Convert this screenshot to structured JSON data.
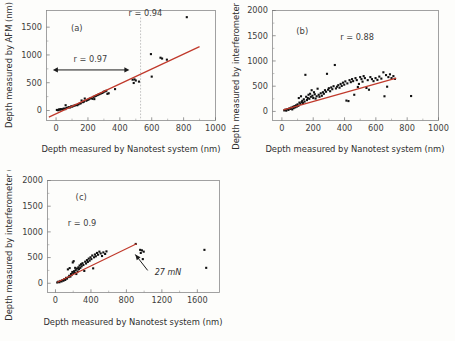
{
  "figure": {
    "background_color": "#fdfdfb",
    "point_color": "#111111",
    "fit_line_color": "#c0392b",
    "axis_color": "#8a8a8a"
  },
  "panels": [
    {
      "id": "a",
      "label": "(a)",
      "xlabel": "Depth measured by Nanotest system (nm)",
      "ylabel": "Depth measured by AFM (nm)",
      "xlim": [
        -60,
        1000
      ],
      "ylim": [
        -180,
        1800
      ],
      "xticks": [
        0,
        200,
        400,
        600,
        800,
        1000
      ],
      "yticks": [
        0,
        500,
        1000,
        1500
      ],
      "xticklabels": [
        "0",
        "200",
        "400",
        "600",
        "800",
        "1000"
      ],
      "yticklabels": [
        "0",
        "500",
        "1000",
        "1500"
      ],
      "annotations": [
        {
          "name": "r-overall",
          "text": "r = 0.94",
          "x": 560,
          "y": 1700
        },
        {
          "name": "r-restricted",
          "text": "r = 0.97",
          "x": 215,
          "y": 880
        }
      ],
      "vertical_divider_x": 530,
      "range_arrow": {
        "x_start": -20,
        "x_end": 460,
        "y": 730
      },
      "fit_line": {
        "x1": -45,
        "y1": -120,
        "x2": 900,
        "y2": 1150
      }
    },
    {
      "id": "b",
      "label": "(b)",
      "xlabel": "Depth measured by Nanotest system (nm)",
      "ylabel": "Depth measured by interferometer (nm)",
      "xlim": [
        -60,
        1000
      ],
      "ylim": [
        -180,
        2000
      ],
      "xticks": [
        0,
        200,
        400,
        600,
        800,
        1000
      ],
      "yticks": [
        0,
        500,
        1000,
        1500,
        2000
      ],
      "xticklabels": [
        "0",
        "200",
        "400",
        "600",
        "800",
        "1000"
      ],
      "yticklabels": [
        "0",
        "500",
        "1000",
        "1500",
        "2000"
      ],
      "annotations": [
        {
          "name": "r-overall",
          "text": "r = 0.88",
          "x": 480,
          "y": 1420
        }
      ],
      "fit_line": {
        "x1": 10,
        "y1": 30,
        "x2": 730,
        "y2": 660
      }
    },
    {
      "id": "c",
      "label": "(c)",
      "xlabel": "Depth measured by Nanotest system (nm)",
      "ylabel": "Depth measured by interferometer (nm)",
      "xlim": [
        -90,
        1850
      ],
      "ylim": [
        -180,
        2000
      ],
      "xticks": [
        0,
        400,
        800,
        1200,
        1600
      ],
      "yticks": [
        0,
        500,
        1000,
        1500,
        2000
      ],
      "xticklabels": [
        "0",
        "400",
        "800",
        "1200",
        "1600"
      ],
      "yticklabels": [
        "0",
        "500",
        "1000",
        "1500",
        "2000"
      ],
      "annotations": [
        {
          "name": "r-overall",
          "text": "r = 0.9",
          "x": 300,
          "y": 1120
        },
        {
          "name": "load-annotation",
          "text": "27 mN",
          "x": 1060,
          "y": 190
        }
      ],
      "load_arrow": {
        "x_start": 1040,
        "y_start": 250,
        "x_end": 900,
        "y_end": 560
      },
      "fit_line": {
        "x1": 20,
        "y1": 20,
        "x2": 915,
        "y2": 770
      }
    }
  ],
  "chart_data": [
    {
      "type": "scatter",
      "panel": "a",
      "title": "(a)",
      "xlabel": "Depth measured by Nanotest system (nm)",
      "ylabel": "Depth measured by AFM (nm)",
      "xlim": [
        -60,
        1000
      ],
      "ylim": [
        -180,
        1800
      ],
      "grid": false,
      "legend": "none",
      "correlation_overall": 0.94,
      "correlation_restricted": 0.97,
      "points": [
        [
          5,
          10
        ],
        [
          12,
          5
        ],
        [
          18,
          20
        ],
        [
          25,
          15
        ],
        [
          30,
          25
        ],
        [
          38,
          20
        ],
        [
          45,
          30
        ],
        [
          52,
          35
        ],
        [
          58,
          25
        ],
        [
          65,
          45
        ],
        [
          60,
          95
        ],
        [
          72,
          50
        ],
        [
          80,
          60
        ],
        [
          88,
          55
        ],
        [
          95,
          75
        ],
        [
          102,
          70
        ],
        [
          110,
          85
        ],
        [
          118,
          90
        ],
        [
          125,
          100
        ],
        [
          133,
          95
        ],
        [
          140,
          110
        ],
        [
          148,
          125
        ],
        [
          155,
          130
        ],
        [
          160,
          180
        ],
        [
          168,
          150
        ],
        [
          175,
          160
        ],
        [
          180,
          215
        ],
        [
          190,
          175
        ],
        [
          198,
          190
        ],
        [
          205,
          200
        ],
        [
          212,
          215
        ],
        [
          220,
          225
        ],
        [
          228,
          210
        ],
        [
          235,
          245
        ],
        [
          243,
          255
        ],
        [
          240,
          205
        ],
        [
          250,
          265
        ],
        [
          258,
          275
        ],
        [
          265,
          285
        ],
        [
          272,
          295
        ],
        [
          280,
          305
        ],
        [
          288,
          315
        ],
        [
          295,
          325
        ],
        [
          300,
          340
        ],
        [
          308,
          345
        ],
        [
          315,
          355
        ],
        [
          322,
          300
        ],
        [
          330,
          310
        ],
        [
          370,
          385
        ],
        [
          480,
          555
        ],
        [
          487,
          495
        ],
        [
          492,
          560
        ],
        [
          500,
          540
        ],
        [
          520,
          520
        ],
        [
          595,
          1015
        ],
        [
          600,
          610
        ],
        [
          655,
          950
        ],
        [
          665,
          935
        ],
        [
          695,
          915
        ],
        [
          820,
          1680
        ]
      ]
    },
    {
      "type": "scatter",
      "panel": "b",
      "title": "(b)",
      "xlabel": "Depth measured by Nanotest system (nm)",
      "ylabel": "Depth measured by interferometer (nm)",
      "xlim": [
        -60,
        1000
      ],
      "ylim": [
        -180,
        2000
      ],
      "grid": false,
      "legend": "none",
      "correlation_overall": 0.88,
      "points": [
        [
          15,
          20
        ],
        [
          22,
          35
        ],
        [
          28,
          15
        ],
        [
          35,
          45
        ],
        [
          42,
          30
        ],
        [
          48,
          60
        ],
        [
          55,
          50
        ],
        [
          60,
          75
        ],
        [
          66,
          40
        ],
        [
          70,
          90
        ],
        [
          75,
          65
        ],
        [
          80,
          105
        ],
        [
          85,
          80
        ],
        [
          90,
          120
        ],
        [
          95,
          95
        ],
        [
          100,
          140
        ],
        [
          105,
          110
        ],
        [
          108,
          265
        ],
        [
          112,
          175
        ],
        [
          118,
          150
        ],
        [
          122,
          300
        ],
        [
          126,
          185
        ],
        [
          130,
          210
        ],
        [
          135,
          165
        ],
        [
          140,
          240
        ],
        [
          145,
          195
        ],
        [
          150,
          725
        ],
        [
          155,
          290
        ],
        [
          160,
          225
        ],
        [
          165,
          265
        ],
        [
          170,
          330
        ],
        [
          175,
          250
        ],
        [
          180,
          350
        ],
        [
          185,
          290
        ],
        [
          190,
          420
        ],
        [
          195,
          310
        ],
        [
          200,
          265
        ],
        [
          205,
          380
        ],
        [
          210,
          340
        ],
        [
          215,
          255
        ],
        [
          222,
          300
        ],
        [
          228,
          450
        ],
        [
          235,
          330
        ],
        [
          240,
          290
        ],
        [
          248,
          360
        ],
        [
          255,
          310
        ],
        [
          262,
          380
        ],
        [
          268,
          350
        ],
        [
          275,
          420
        ],
        [
          282,
          390
        ],
        [
          288,
          745
        ],
        [
          295,
          430
        ],
        [
          300,
          460
        ],
        [
          308,
          400
        ],
        [
          315,
          475
        ],
        [
          322,
          440
        ],
        [
          330,
          500
        ],
        [
          338,
          920
        ],
        [
          345,
          455
        ],
        [
          352,
          490
        ],
        [
          360,
          520
        ],
        [
          368,
          470
        ],
        [
          375,
          545
        ],
        [
          382,
          505
        ],
        [
          390,
          570
        ],
        [
          398,
          530
        ],
        [
          405,
          595
        ],
        [
          412,
          215
        ],
        [
          418,
          555
        ],
        [
          425,
          205
        ],
        [
          432,
          620
        ],
        [
          440,
          580
        ],
        [
          448,
          640
        ],
        [
          455,
          600
        ],
        [
          462,
          330
        ],
        [
          470,
          660
        ],
        [
          478,
          620
        ],
        [
          485,
          485
        ],
        [
          492,
          545
        ],
        [
          500,
          680
        ],
        [
          508,
          640
        ],
        [
          515,
          590
        ],
        [
          522,
          700
        ],
        [
          530,
          660
        ],
        [
          540,
          465
        ],
        [
          548,
          620
        ],
        [
          556,
          430
        ],
        [
          565,
          680
        ],
        [
          575,
          640
        ],
        [
          585,
          600
        ],
        [
          598,
          660
        ],
        [
          610,
          625
        ],
        [
          622,
          690
        ],
        [
          635,
          650
        ],
        [
          648,
          775
        ],
        [
          655,
          300
        ],
        [
          665,
          720
        ],
        [
          672,
          490
        ],
        [
          680,
          680
        ],
        [
          690,
          735
        ],
        [
          700,
          660
        ],
        [
          712,
          700
        ],
        [
          722,
          645
        ],
        [
          825,
          305
        ]
      ]
    },
    {
      "type": "scatter",
      "panel": "c",
      "title": "(c)",
      "xlabel": "Depth measured by Nanotest system (nm)",
      "ylabel": "Depth measured by interferometer (nm)",
      "xlim": [
        -90,
        1850
      ],
      "ylim": [
        -180,
        2000
      ],
      "grid": false,
      "legend": "none",
      "correlation_overall": 0.9,
      "annotation_load": "27 mN",
      "points": [
        [
          20,
          15
        ],
        [
          32,
          30
        ],
        [
          45,
          20
        ],
        [
          55,
          45
        ],
        [
          68,
          35
        ],
        [
          78,
          60
        ],
        [
          90,
          50
        ],
        [
          100,
          80
        ],
        [
          110,
          65
        ],
        [
          120,
          105
        ],
        [
          130,
          90
        ],
        [
          140,
          270
        ],
        [
          148,
          120
        ],
        [
          155,
          145
        ],
        [
          160,
          295
        ],
        [
          168,
          130
        ],
        [
          175,
          180
        ],
        [
          182,
          160
        ],
        [
          190,
          220
        ],
        [
          195,
          405
        ],
        [
          200,
          195
        ],
        [
          205,
          430
        ],
        [
          210,
          235
        ],
        [
          218,
          205
        ],
        [
          222,
          300
        ],
        [
          228,
          255
        ],
        [
          235,
          180
        ],
        [
          242,
          285
        ],
        [
          250,
          230
        ],
        [
          258,
          310
        ],
        [
          265,
          275
        ],
        [
          272,
          345
        ],
        [
          280,
          300
        ],
        [
          288,
          370
        ],
        [
          295,
          330
        ],
        [
          305,
          390
        ],
        [
          315,
          355
        ],
        [
          325,
          240
        ],
        [
          335,
          420
        ],
        [
          345,
          385
        ],
        [
          355,
          450
        ],
        [
          365,
          415
        ],
        [
          375,
          480
        ],
        [
          385,
          440
        ],
        [
          395,
          505
        ],
        [
          405,
          470
        ],
        [
          415,
          540
        ],
        [
          425,
          290
        ],
        [
          435,
          505
        ],
        [
          445,
          560
        ],
        [
          455,
          525
        ],
        [
          468,
          590
        ],
        [
          480,
          555
        ],
        [
          495,
          615
        ],
        [
          510,
          580
        ],
        [
          525,
          530
        ],
        [
          540,
          600
        ],
        [
          560,
          570
        ],
        [
          575,
          620
        ],
        [
          905,
          765
        ],
        [
          955,
          650
        ],
        [
          962,
          590
        ],
        [
          975,
          640
        ],
        [
          985,
          470
        ],
        [
          995,
          615
        ],
        [
          1680,
          650
        ],
        [
          1700,
          300
        ]
      ]
    }
  ]
}
